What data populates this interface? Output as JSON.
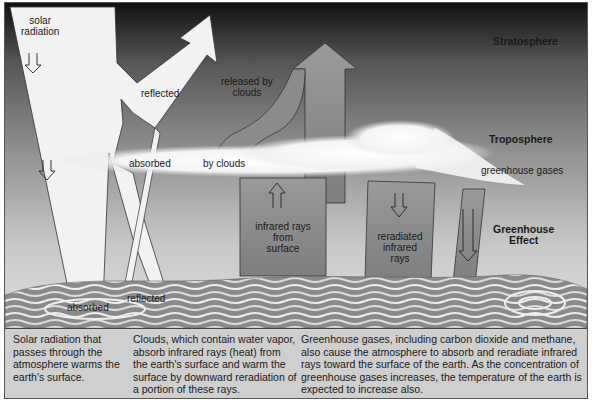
{
  "diagram": {
    "title": "Greenhouse Effect",
    "layers": {
      "stratosphere": "Stratosphere",
      "troposphere": "Troposphere",
      "greenhouse_gases": "greenhouse gases",
      "greenhouse_effect_line1": "Greenhouse",
      "greenhouse_effect_line2": "Effect"
    },
    "arrows": {
      "solar_radiation_line1": "solar",
      "solar_radiation_line2": "radiation",
      "reflected_top": "reflected",
      "released_line1": "released by",
      "released_line2": "clouds",
      "absorbed_clouds": "absorbed",
      "by_clouds": "by clouds",
      "infrared_line1": "infrared rays",
      "infrared_line2": "from",
      "infrared_line3": "surface",
      "reradiated_line1": "reradiated",
      "reradiated_line2": "infrared",
      "reradiated_line3": "rays",
      "absorbed_ground": "absorbed",
      "reflected_ground": "reflected"
    },
    "colors": {
      "sky_top": "#1a1a1a",
      "sky_bottom": "#d8d8d8",
      "beam_white": "#f2f2f2",
      "ray_gray": "#8a8a8a",
      "caption_bg": "#cfcfcf"
    }
  },
  "captions": [
    "Solar radiation that passes through the atmosphere warms the earth's surface.",
    "Clouds, which contain water vapor, absorb infrared rays (heat) from the earth's surface and warm the surface by downward reradiation of a portion of these rays.",
    "Greenhouse gases, including carbon dioxide and methane, also cause the atmosphere to absorb and reradiate infrared rays toward the surface of the earth. As the concentration of greenhouse gases increases, the temperature of the earth is expected to increase also."
  ]
}
